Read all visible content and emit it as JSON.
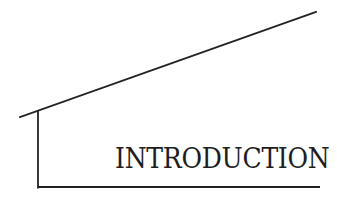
{
  "title": {
    "text": "INTRODUCTION"
  },
  "colors": {
    "background": "#ffffff",
    "ink": "#1e1e1e",
    "line": "#222222"
  },
  "geometry": {
    "diagonal": {
      "x1": 20,
      "y1": 117,
      "x2": 316,
      "y2": 12
    },
    "vertical": {
      "x1": 38,
      "y1": 111,
      "x2": 38,
      "y2": 187
    },
    "baseline": {
      "x1": 38,
      "y1": 187,
      "x2": 320,
      "y2": 187
    }
  }
}
